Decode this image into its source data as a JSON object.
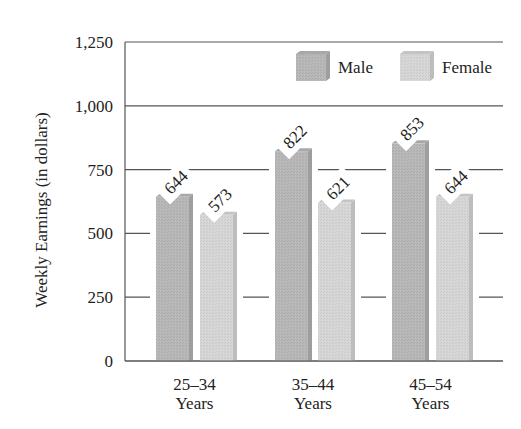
{
  "chart_data": {
    "type": "bar",
    "title": "",
    "xlabel": "",
    "ylabel": "Weekly Earnings (in dollars)",
    "categories": [
      "25–34 Years",
      "35–44 Years",
      "45–54 Years"
    ],
    "category_lines": [
      [
        "25–34",
        "Years"
      ],
      [
        "35–44",
        "Years"
      ],
      [
        "45–54",
        "Years"
      ]
    ],
    "series": [
      {
        "name": "Male",
        "values": [
          644,
          822,
          853
        ],
        "color": "#b8b8b8"
      },
      {
        "name": "Female",
        "values": [
          573,
          621,
          644
        ],
        "color": "#d6d6d6"
      }
    ],
    "data_labels": [
      "644",
      "573",
      "822",
      "621",
      "853",
      "644"
    ],
    "ylim": [
      0,
      1250
    ],
    "yticks": [
      0,
      250,
      500,
      750,
      1000,
      1250
    ],
    "ytick_labels": [
      "0",
      "250",
      "500",
      "750",
      "1,000",
      "1,250"
    ],
    "grid": true,
    "legend_position": "top-right",
    "style": "3d-bars"
  }
}
